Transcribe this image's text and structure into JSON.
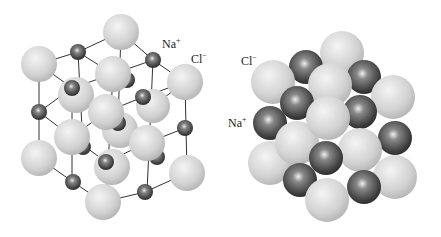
{
  "colors": {
    "cl": "#d6d6d6",
    "na": "#555555",
    "bond": "#333333",
    "background": "#ffffff"
  },
  "left_diagram": {
    "name": "ball-and-stick lattice",
    "labels": [
      {
        "ion": "Na",
        "charge": "+",
        "x": 162,
        "y": 38
      },
      {
        "ion": "Cl",
        "charge": "−",
        "x": 191,
        "y": 53
      }
    ]
  },
  "right_diagram": {
    "name": "space-filling model",
    "labels": [
      {
        "ion": "Cl",
        "charge": "−",
        "x": 241,
        "y": 55
      },
      {
        "ion": "Na",
        "charge": "+",
        "x": 228,
        "y": 117
      }
    ]
  }
}
